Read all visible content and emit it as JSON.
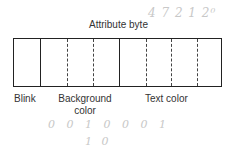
{
  "diagram": {
    "title": "Attribute byte",
    "bits": 8,
    "fields": [
      {
        "label": "Blink",
        "bits": 1
      },
      {
        "label": "Background color",
        "bits": 3
      },
      {
        "label": "Text color",
        "bits": 4
      }
    ],
    "labels": {
      "blink": "Blink",
      "background_line1": "Background",
      "background_line2": "color",
      "text_color": "Text color"
    },
    "handwritten": {
      "top": "4  7  2  1  2⁰",
      "bits_row": "0  0  1  0  0  0  1",
      "bottom": "1  0"
    }
  }
}
